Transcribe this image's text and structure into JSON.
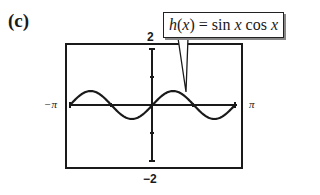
{
  "panel_label": "(c)",
  "callout": {
    "fn_name": "h",
    "arg": "x",
    "expression_text": "h(x) = sin x cos x",
    "rhs": " = sin ",
    "rhs2": " cos "
  },
  "axes": {
    "y_max_label": "2",
    "y_min_label": "−2",
    "x_min_label": "−π",
    "x_max_label": "π"
  },
  "chart_data": {
    "type": "line",
    "title": "h(x) = sin x cos x",
    "xlabel": "",
    "ylabel": "",
    "xlim": [
      -3.1416,
      3.1416
    ],
    "ylim": [
      -2,
      2
    ],
    "x_tick_labels": [
      "−π",
      "π"
    ],
    "y_tick_labels": [
      "2",
      "−2"
    ],
    "x_ticks": [
      -3.1416,
      -1.5708,
      0,
      1.5708,
      3.1416
    ],
    "y_ticks": [
      -2,
      -1,
      0,
      1,
      2
    ],
    "grid": false,
    "legend": "callout annotation top-right pointing to curve",
    "series": [
      {
        "name": "h(x) = sin x cos x",
        "x": [
          -3.1416,
          -2.7489,
          -2.3562,
          -1.9635,
          -1.5708,
          -1.1781,
          -0.7854,
          -0.3927,
          0,
          0.3927,
          0.7854,
          1.1781,
          1.5708,
          1.9635,
          2.3562,
          2.7489,
          3.1416
        ],
        "values": [
          0,
          0.3536,
          0.5,
          0.3536,
          0,
          -0.3536,
          -0.5,
          -0.3536,
          0,
          0.3536,
          0.5,
          0.3536,
          0,
          -0.3536,
          -0.5,
          -0.3536,
          0
        ]
      }
    ]
  }
}
